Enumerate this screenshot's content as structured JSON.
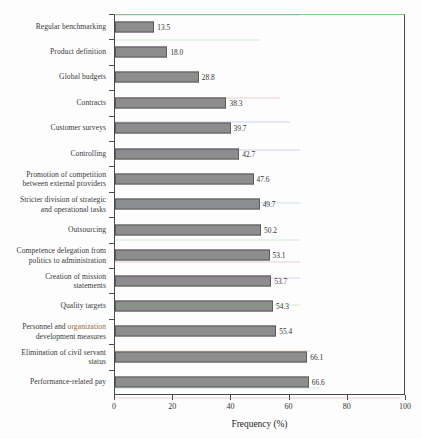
{
  "chart_data": {
    "type": "bar",
    "orientation": "horizontal",
    "title": "",
    "xlabel": "Frequency (%)",
    "ylabel": "",
    "xlim": [
      0,
      100
    ],
    "xticks": [
      0,
      20,
      40,
      60,
      80,
      100
    ],
    "grid": false,
    "legend": null,
    "categories": [
      "Regular benchmarking",
      "Product definition",
      "Global budgets",
      "Contracts",
      "Customer surveys",
      "Controlling",
      "Promotion of competition\nbetween external providers",
      "Stricter division of strategic\nand operational tasks",
      "Outsourcing",
      "Competence delegation from\npolitics to administration",
      "Creation of mission\nstatements",
      "Quality targets",
      "Personnel and organization\ndevelopment measures",
      "Elimination of civil servant\nstatus",
      "Performance-related pay"
    ],
    "values": [
      13.5,
      18.0,
      28.8,
      38.3,
      39.7,
      42.7,
      47.6,
      49.7,
      50.2,
      53.1,
      53.7,
      54.3,
      55.4,
      66.1,
      66.6
    ],
    "value_labels": [
      "13.5",
      "18.0",
      "28.8",
      "38.3",
      "39.7",
      "42.7",
      "47.6",
      "49.7",
      "50.2",
      "53.1",
      "53.7",
      "54.3",
      "55.4",
      "66.1",
      "66.6"
    ],
    "highlighted_word": "organization",
    "highlighted_in_category_index": 12,
    "colors": {
      "bar_fill": "#8d8d8d",
      "bar_edge": "#5a5a5a",
      "axis": "#4a4a4a",
      "text": "#333333",
      "background": "#fdfdfd",
      "highlight_text": "#9a6a3a",
      "frame_top_tint": "#7fd07f"
    }
  }
}
